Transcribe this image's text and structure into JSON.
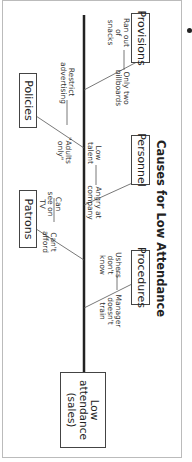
{
  "diagram": {
    "type": "fishbone",
    "title": "Causes for Low Attendance",
    "effect": "Low attendance (sales)",
    "categories": [
      {
        "name": "Provisions",
        "causes": [
          "Ran out of snacks",
          "Only two billboards"
        ]
      },
      {
        "name": "Policies",
        "causes": [
          "Restrict advertising",
          "\"Adults only\""
        ]
      },
      {
        "name": "Personnel",
        "causes": [
          "Low talent",
          "Angry at company"
        ]
      },
      {
        "name": "Patrons",
        "causes": [
          "Can see on TV",
          "Can't afford"
        ]
      },
      {
        "name": "Procedures",
        "causes": [
          "Ushers don't know",
          "Manager doesn't train"
        ]
      }
    ]
  }
}
